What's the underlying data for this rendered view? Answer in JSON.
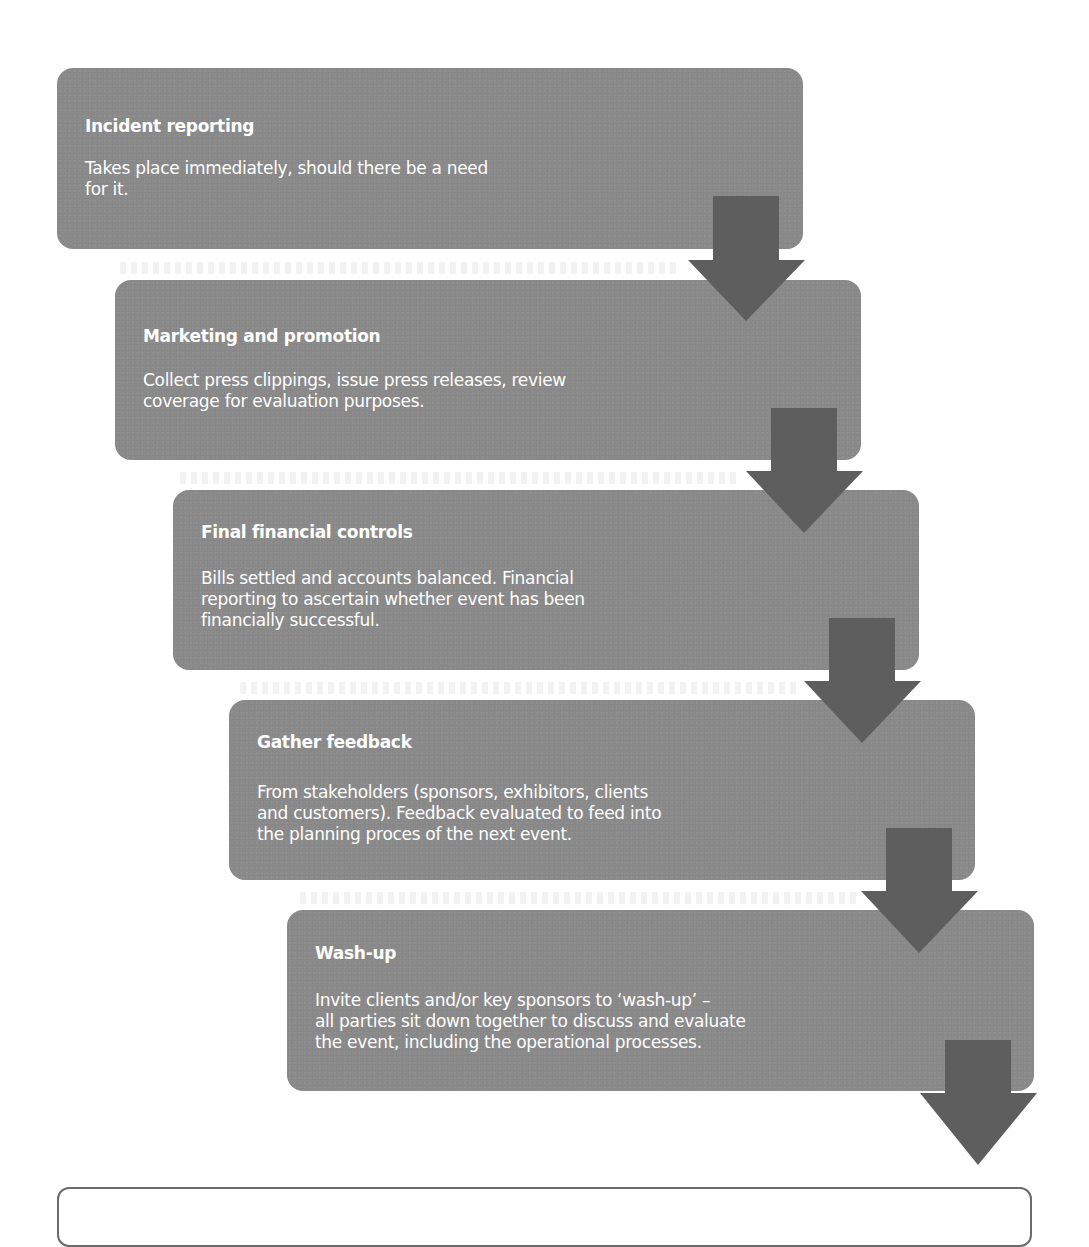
{
  "diagram": {
    "type": "cascading-process-flow",
    "colors": {
      "box_fill": "#8a8a8a",
      "arrow_fill": "#5e5e5e",
      "text": "#ffffff",
      "caption_border": "#6b6b6b"
    },
    "steps": [
      {
        "title": "Incident reporting",
        "description": "Takes place immediately, should there be a need\nfor it."
      },
      {
        "title": "Marketing and promotion",
        "description": "Collect press clippings, issue press releases, review\ncoverage for evaluation purposes."
      },
      {
        "title": "Final financial controls",
        "description": "Bills settled and accounts balanced. Financial\nreporting to ascertain whether event has been\nfinancially successful."
      },
      {
        "title": "Gather feedback",
        "description": "From stakeholders (sponsors, exhibitors, clients\nand customers). Feedback evaluated to feed into\nthe planning proces of the next event."
      },
      {
        "title": "Wash-up",
        "description": "Invite clients and/or key sponsors to ‘wash-up’ –\nall parties sit down together to discuss and evaluate\nthe event, including the operational processes."
      }
    ],
    "arrow_icon": "down-arrow-icon",
    "caption": ""
  }
}
